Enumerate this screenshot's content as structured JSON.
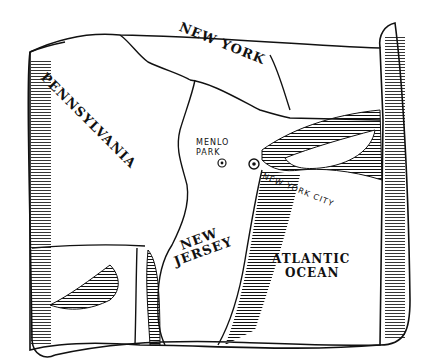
{
  "map": {
    "title": "Hand-drawn scroll map of New Jersey region",
    "ink_color": "#111111",
    "paper_color": "#ffffff",
    "labels": {
      "new_york": "NEW YORK",
      "pennsylvania": "PENNSYLVANIA",
      "new_jersey_line1": "NEW",
      "new_jersey_line2": "JERSEY",
      "menlo_park_line1": "MENLO",
      "menlo_park_line2": "PARK",
      "new_york_city": "NEW YORK CITY",
      "atlantic_line1": "ATLANTIC",
      "atlantic_line2": "OCEAN"
    },
    "markers": [
      {
        "name": "Menlo Park",
        "icon": "circle-dot"
      },
      {
        "name": "New York City",
        "icon": "circle-dot"
      }
    ]
  }
}
